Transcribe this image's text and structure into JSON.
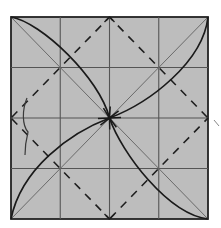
{
  "diagram": {
    "type": "origami-fold-diagram",
    "grid_divisions": 4,
    "colors": {
      "paper": "#bdbdbd",
      "grid_line": "#555555",
      "edge": "#222222",
      "diagonal": "#6a6a6a",
      "dashed_fold": "#1e1e1e",
      "arrow": "#1a1a1a",
      "background": "#ffffff"
    },
    "folds": [
      {
        "name": "valley-fold-top-left",
        "from": "top-mid",
        "to": "left-mid",
        "style": "dashed"
      },
      {
        "name": "valley-fold-top-right",
        "from": "top-mid",
        "to": "right-mid",
        "style": "dashed"
      },
      {
        "name": "valley-fold-bottom-right",
        "from": "right-mid",
        "to": "bottom-mid",
        "style": "dashed"
      },
      {
        "name": "valley-fold-bottom-left",
        "from": "bottom-mid",
        "to": "left-mid",
        "style": "dashed"
      }
    ],
    "arrows": [
      {
        "name": "arrow-top-left-corner-to-center",
        "from": "top-left",
        "to": "center"
      },
      {
        "name": "arrow-top-right-corner-to-center",
        "from": "top-right",
        "to": "center"
      },
      {
        "name": "arrow-bottom-left-corner-to-center",
        "from": "bottom-left",
        "to": "center"
      },
      {
        "name": "arrow-bottom-right-corner-to-center",
        "from": "bottom-right",
        "to": "center"
      }
    ]
  }
}
